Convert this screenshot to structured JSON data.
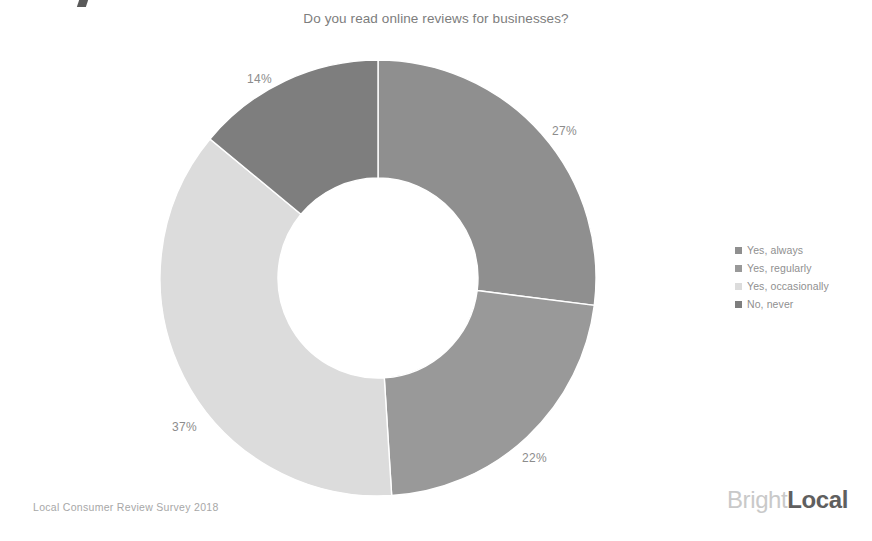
{
  "chart_data": {
    "type": "pie",
    "variant": "donut",
    "title": "Do you read online reviews for businesses?",
    "xlabel": "",
    "ylabel": "",
    "unit": "%",
    "legend_position": "right",
    "grid": false,
    "start_angle_deg": 0,
    "direction": "clockwise",
    "categories": [
      "Yes, always",
      "Yes, regularly",
      "Yes, occasionally",
      "No, never"
    ],
    "values": [
      27,
      22,
      37,
      14
    ],
    "labels": [
      "27%",
      "22%",
      "37%",
      "14%"
    ],
    "colors": [
      "#8f8f8f",
      "#999999",
      "#dcdcdc",
      "#7e7e7e"
    ],
    "slices": [
      {
        "label": "Yes, always",
        "value": 27,
        "display": "27%",
        "color": "#8f8f8f"
      },
      {
        "label": "Yes, regularly",
        "value": 22,
        "display": "22%",
        "color": "#999999"
      },
      {
        "label": "Yes, occasionally",
        "value": 37,
        "display": "37%",
        "color": "#dcdcdc"
      },
      {
        "label": "No, never",
        "value": 14,
        "display": "14%",
        "color": "#7e7e7e"
      }
    ]
  },
  "header": {
    "title": "Do you read online reviews for businesses?"
  },
  "legend": {
    "items": [
      {
        "label": "Yes, always",
        "color": "#8f8f8f"
      },
      {
        "label": "Yes, regularly",
        "color": "#999999"
      },
      {
        "label": "Yes, occasionally",
        "color": "#dcdcdc"
      },
      {
        "label": "No, never",
        "color": "#7e7e7e"
      }
    ]
  },
  "footer": {
    "source": "Local Consumer Review Survey 2018",
    "brand_primary": "Bright",
    "brand_secondary": "Local"
  }
}
